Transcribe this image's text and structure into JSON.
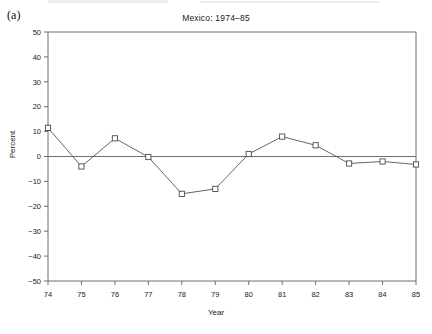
{
  "figure": {
    "panel_label": "(a)",
    "background_color": "#ffffff",
    "line_color": "#555555",
    "axis_color": "#6f6f6f",
    "marker_fill": "#ffffff",
    "marker_edge": "#4a4a4a"
  },
  "chart_data": {
    "type": "line",
    "title": "Mexico: 1974–85",
    "subtitle": "",
    "xlabel": "Year",
    "ylabel": "Percent",
    "x": [
      74,
      75,
      76,
      77,
      78,
      79,
      80,
      81,
      82,
      83,
      84,
      85
    ],
    "x_tick_labels": [
      "74",
      "75",
      "76",
      "77",
      "78",
      "79",
      "80",
      "81",
      "82",
      "83",
      "84",
      "85"
    ],
    "values": [
      11.5,
      -4.0,
      7.3,
      -0.2,
      -15.0,
      -13.0,
      1.0,
      8.0,
      4.5,
      -2.8,
      -2.0,
      -3.2
    ],
    "series": [
      {
        "name": "Percent",
        "values": [
          11.5,
          -4.0,
          7.3,
          -0.2,
          -15.0,
          -13.0,
          1.0,
          8.0,
          4.5,
          -2.8,
          -2.0,
          -3.2
        ],
        "marker": "square",
        "line_style": "solid"
      }
    ],
    "y_tick_labels": [
      "50",
      "40",
      "30",
      "20",
      "10",
      "0",
      "−10",
      "−20",
      "−30",
      "−40",
      "−50"
    ],
    "y_ticks": [
      50,
      40,
      30,
      20,
      10,
      0,
      -10,
      -20,
      -30,
      -40,
      -50
    ],
    "ylim": [
      -50,
      50
    ],
    "xlim": [
      74,
      85
    ],
    "grid": false,
    "zero_line": true,
    "legend": "none",
    "legend_position": "none",
    "annotations": []
  }
}
